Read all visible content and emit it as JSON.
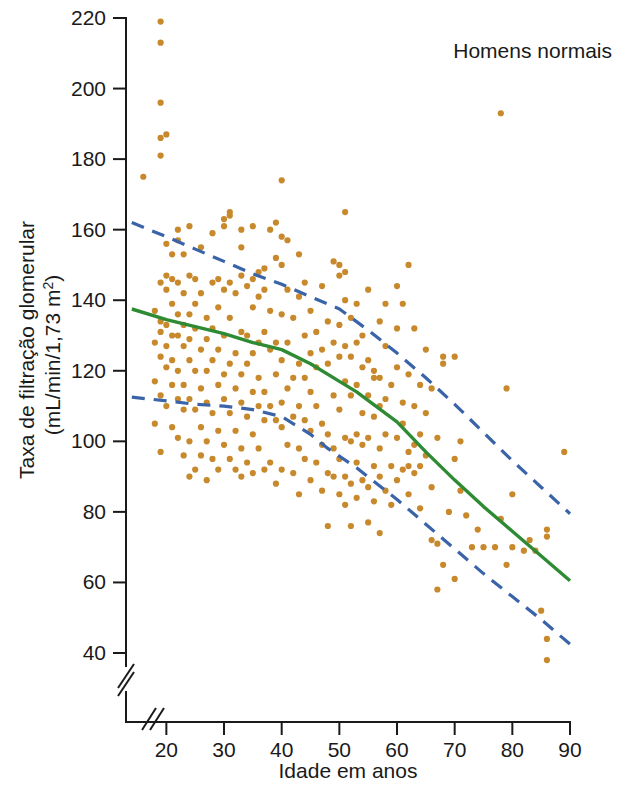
{
  "chart_data": {
    "type": "scatter",
    "title": "Homens normais",
    "xlabel": "Idade em anos",
    "ylabel_line1": "Taxa de filtração glomerular",
    "ylabel_line2": "(mL/min/1,73 m",
    "ylabel_line2_sup": "2",
    "ylabel_line2_end": ")",
    "xlim": [
      13,
      90
    ],
    "ylim": [
      33,
      222
    ],
    "xticks": [
      20,
      30,
      40,
      50,
      60,
      70,
      80,
      90
    ],
    "yticks": [
      40,
      60,
      80,
      100,
      120,
      140,
      160,
      180,
      200,
      220
    ],
    "grid": false,
    "legend": "none",
    "axis_break_x": true,
    "axis_break_y": true,
    "colors": {
      "points": "#c8892c",
      "mean_line": "#2e8b33",
      "bound_line": "#3a63a8",
      "axis": "#1a1a1a",
      "background": "#ffffff"
    },
    "series": [
      {
        "name": "Média (regressão)",
        "type": "line",
        "style": "solid",
        "color": "#2e8b33",
        "points": [
          [
            14,
            137.5
          ],
          [
            20,
            134.5
          ],
          [
            25,
            132.5
          ],
          [
            30,
            130.5
          ],
          [
            35,
            128.0
          ],
          [
            40,
            126.0
          ],
          [
            45,
            122.0
          ],
          [
            50,
            117.0
          ],
          [
            53,
            114.0
          ],
          [
            60,
            105.5
          ],
          [
            65,
            97.0
          ],
          [
            70,
            89.0
          ],
          [
            75,
            81.5
          ],
          [
            80,
            74.5
          ],
          [
            85,
            67.5
          ],
          [
            90,
            60.5
          ]
        ]
      },
      {
        "name": "Limite superior",
        "type": "line",
        "style": "dashed",
        "color": "#3a63a8",
        "points": [
          [
            14,
            162.0
          ],
          [
            20,
            158.0
          ],
          [
            25,
            154.5
          ],
          [
            30,
            151.0
          ],
          [
            35,
            147.5
          ],
          [
            40,
            144.5
          ],
          [
            45,
            141.0
          ],
          [
            50,
            137.5
          ],
          [
            55,
            131.5
          ],
          [
            60,
            125.0
          ],
          [
            65,
            118.0
          ],
          [
            70,
            110.5
          ],
          [
            75,
            102.5
          ],
          [
            80,
            94.5
          ],
          [
            85,
            87.0
          ],
          [
            90,
            79.5
          ]
        ]
      },
      {
        "name": "Limite inferior",
        "type": "line",
        "style": "dashed",
        "color": "#3a63a8",
        "points": [
          [
            14,
            112.5
          ],
          [
            20,
            111.5
          ],
          [
            25,
            110.5
          ],
          [
            30,
            110.0
          ],
          [
            35,
            109.0
          ],
          [
            40,
            107.0
          ],
          [
            45,
            102.0
          ],
          [
            48,
            98.0
          ],
          [
            53,
            92.5
          ],
          [
            60,
            83.5
          ],
          [
            65,
            76.5
          ],
          [
            70,
            69.5
          ],
          [
            75,
            62.5
          ],
          [
            80,
            56.0
          ],
          [
            85,
            49.5
          ],
          [
            90,
            42.5
          ]
        ]
      }
    ],
    "scatter_points": [
      [
        19,
        219
      ],
      [
        19,
        213
      ],
      [
        19,
        196
      ],
      [
        19,
        186
      ],
      [
        20,
        187
      ],
      [
        19,
        181
      ],
      [
        16,
        175
      ],
      [
        40,
        174
      ],
      [
        78,
        193
      ],
      [
        31,
        165
      ],
      [
        51,
        165
      ],
      [
        30,
        163
      ],
      [
        31,
        164
      ],
      [
        30,
        161
      ],
      [
        35,
        161
      ],
      [
        22,
        160
      ],
      [
        24,
        161
      ],
      [
        38,
        160
      ],
      [
        39,
        162
      ],
      [
        40,
        158
      ],
      [
        28,
        159
      ],
      [
        33,
        160
      ],
      [
        41,
        157
      ],
      [
        22,
        157
      ],
      [
        20,
        156
      ],
      [
        26,
        155
      ],
      [
        33,
        155
      ],
      [
        21,
        153
      ],
      [
        23,
        153
      ],
      [
        39,
        152
      ],
      [
        43,
        153
      ],
      [
        49,
        151
      ],
      [
        50,
        150
      ],
      [
        62,
        150
      ],
      [
        51,
        148
      ],
      [
        50,
        147
      ],
      [
        40,
        150
      ],
      [
        37,
        149
      ],
      [
        36,
        148
      ],
      [
        20,
        147
      ],
      [
        24,
        147
      ],
      [
        25,
        146
      ],
      [
        29,
        146
      ],
      [
        33,
        147
      ],
      [
        35,
        146
      ],
      [
        19,
        145
      ],
      [
        21,
        146
      ],
      [
        22,
        145
      ],
      [
        28,
        145
      ],
      [
        31,
        145
      ],
      [
        34,
        144
      ],
      [
        44,
        145
      ],
      [
        47,
        144
      ],
      [
        55,
        143
      ],
      [
        60,
        144
      ],
      [
        30,
        143
      ],
      [
        32,
        142
      ],
      [
        37,
        143
      ],
      [
        41,
        143
      ],
      [
        20,
        143
      ],
      [
        23,
        142
      ],
      [
        26,
        142
      ],
      [
        36,
        141
      ],
      [
        43,
        141
      ],
      [
        51,
        140
      ],
      [
        53,
        139
      ],
      [
        61,
        139
      ],
      [
        21,
        139
      ],
      [
        25,
        139
      ],
      [
        29,
        138
      ],
      [
        35,
        138
      ],
      [
        38,
        137
      ],
      [
        45,
        137
      ],
      [
        18,
        137
      ],
      [
        22,
        136
      ],
      [
        24,
        136
      ],
      [
        27,
        135
      ],
      [
        31,
        135
      ],
      [
        40,
        136
      ],
      [
        42,
        135
      ],
      [
        48,
        134
      ],
      [
        50,
        133
      ],
      [
        52,
        135
      ],
      [
        57,
        134
      ],
      [
        63,
        132
      ],
      [
        19,
        134
      ],
      [
        20,
        133
      ],
      [
        23,
        133
      ],
      [
        25,
        132
      ],
      [
        28,
        132
      ],
      [
        33,
        131
      ],
      [
        34,
        130
      ],
      [
        37,
        131
      ],
      [
        44,
        130
      ],
      [
        46,
        131
      ],
      [
        54,
        130
      ],
      [
        19,
        131
      ],
      [
        21,
        130
      ],
      [
        22,
        130
      ],
      [
        24,
        129
      ],
      [
        27,
        129
      ],
      [
        30,
        130
      ],
      [
        36,
        128
      ],
      [
        39,
        128
      ],
      [
        41,
        128
      ],
      [
        49,
        128
      ],
      [
        51,
        127
      ],
      [
        53,
        128
      ],
      [
        58,
        127
      ],
      [
        18,
        128
      ],
      [
        20,
        127
      ],
      [
        23,
        127
      ],
      [
        26,
        126
      ],
      [
        29,
        126
      ],
      [
        32,
        125
      ],
      [
        35,
        125
      ],
      [
        38,
        126
      ],
      [
        45,
        125
      ],
      [
        47,
        126
      ],
      [
        50,
        124
      ],
      [
        52,
        124
      ],
      [
        55,
        123
      ],
      [
        68,
        124
      ],
      [
        70,
        124
      ],
      [
        68,
        122
      ],
      [
        19,
        124
      ],
      [
        21,
        123
      ],
      [
        24,
        123
      ],
      [
        28,
        123
      ],
      [
        31,
        122
      ],
      [
        34,
        122
      ],
      [
        40,
        123
      ],
      [
        43,
        122
      ],
      [
        46,
        121
      ],
      [
        48,
        122
      ],
      [
        54,
        121
      ],
      [
        56,
        120
      ],
      [
        60,
        121
      ],
      [
        62,
        119
      ],
      [
        20,
        121
      ],
      [
        22,
        120
      ],
      [
        25,
        120
      ],
      [
        27,
        120
      ],
      [
        30,
        119
      ],
      [
        33,
        119
      ],
      [
        36,
        118
      ],
      [
        39,
        119
      ],
      [
        42,
        118
      ],
      [
        44,
        118
      ],
      [
        51,
        117
      ],
      [
        53,
        116
      ],
      [
        57,
        118
      ],
      [
        59,
        116
      ],
      [
        64,
        116
      ],
      [
        79,
        115
      ],
      [
        18,
        117
      ],
      [
        21,
        116
      ],
      [
        23,
        116
      ],
      [
        26,
        115
      ],
      [
        29,
        116
      ],
      [
        32,
        115
      ],
      [
        35,
        114
      ],
      [
        37,
        114
      ],
      [
        41,
        115
      ],
      [
        45,
        114
      ],
      [
        49,
        113
      ],
      [
        52,
        113
      ],
      [
        55,
        113
      ],
      [
        58,
        112
      ],
      [
        61,
        111
      ],
      [
        63,
        110
      ],
      [
        19,
        113
      ],
      [
        22,
        112
      ],
      [
        24,
        112
      ],
      [
        27,
        111
      ],
      [
        30,
        112
      ],
      [
        33,
        111
      ],
      [
        36,
        110
      ],
      [
        38,
        110
      ],
      [
        40,
        111
      ],
      [
        43,
        110
      ],
      [
        46,
        110
      ],
      [
        50,
        109
      ],
      [
        54,
        108
      ],
      [
        56,
        107
      ],
      [
        65,
        108
      ],
      [
        20,
        110
      ],
      [
        23,
        109
      ],
      [
        25,
        109
      ],
      [
        28,
        108
      ],
      [
        31,
        108
      ],
      [
        34,
        107
      ],
      [
        37,
        106
      ],
      [
        39,
        106
      ],
      [
        42,
        107
      ],
      [
        44,
        106
      ],
      [
        47,
        105
      ],
      [
        18,
        105
      ],
      [
        21,
        104
      ],
      [
        26,
        104
      ],
      [
        29,
        103
      ],
      [
        32,
        103
      ],
      [
        35,
        102
      ],
      [
        40,
        104
      ],
      [
        45,
        103
      ],
      [
        48,
        102
      ],
      [
        51,
        101
      ],
      [
        53,
        102
      ],
      [
        55,
        101
      ],
      [
        58,
        102
      ],
      [
        60,
        101
      ],
      [
        67,
        101
      ],
      [
        71,
        100
      ],
      [
        22,
        101
      ],
      [
        24,
        100
      ],
      [
        27,
        100
      ],
      [
        30,
        99
      ],
      [
        33,
        98
      ],
      [
        36,
        98
      ],
      [
        41,
        99
      ],
      [
        43,
        98
      ],
      [
        47,
        99
      ],
      [
        49,
        98
      ],
      [
        52,
        100
      ],
      [
        54,
        99
      ],
      [
        57,
        98
      ],
      [
        62,
        97
      ],
      [
        65,
        96
      ],
      [
        89,
        97
      ],
      [
        19,
        97
      ],
      [
        23,
        96
      ],
      [
        26,
        96
      ],
      [
        28,
        95
      ],
      [
        31,
        95
      ],
      [
        34,
        94
      ],
      [
        38,
        94
      ],
      [
        44,
        95
      ],
      [
        46,
        94
      ],
      [
        50,
        95
      ],
      [
        53,
        94
      ],
      [
        56,
        93
      ],
      [
        59,
        93
      ],
      [
        61,
        92
      ],
      [
        70,
        95
      ],
      [
        25,
        92
      ],
      [
        29,
        92
      ],
      [
        32,
        92
      ],
      [
        35,
        91
      ],
      [
        37,
        92
      ],
      [
        40,
        92
      ],
      [
        42,
        91
      ],
      [
        48,
        91
      ],
      [
        51,
        90
      ],
      [
        54,
        89
      ],
      [
        57,
        90
      ],
      [
        60,
        89
      ],
      [
        63,
        91
      ],
      [
        24,
        90
      ],
      [
        27,
        89
      ],
      [
        33,
        90
      ],
      [
        39,
        88
      ],
      [
        45,
        89
      ],
      [
        49,
        90
      ],
      [
        52,
        88
      ],
      [
        55,
        87
      ],
      [
        58,
        86
      ],
      [
        62,
        85
      ],
      [
        66,
        87
      ],
      [
        71,
        86
      ],
      [
        72,
        79
      ],
      [
        43,
        85
      ],
      [
        47,
        86
      ],
      [
        50,
        85
      ],
      [
        53,
        84
      ],
      [
        56,
        83
      ],
      [
        59,
        82
      ],
      [
        64,
        81
      ],
      [
        69,
        80
      ],
      [
        51,
        82
      ],
      [
        55,
        77
      ],
      [
        48,
        76
      ],
      [
        52,
        76
      ],
      [
        57,
        74
      ],
      [
        66,
        72
      ],
      [
        67,
        71
      ],
      [
        73,
        70
      ],
      [
        75,
        70
      ],
      [
        77,
        70
      ],
      [
        80,
        70
      ],
      [
        82,
        69
      ],
      [
        84,
        69
      ],
      [
        83,
        72
      ],
      [
        86,
        73
      ],
      [
        86,
        75
      ],
      [
        80,
        85
      ],
      [
        78,
        78
      ],
      [
        74,
        75
      ],
      [
        68,
        65
      ],
      [
        79,
        65
      ],
      [
        67,
        58
      ],
      [
        70,
        61
      ],
      [
        85,
        52
      ],
      [
        86,
        44
      ],
      [
        86,
        38
      ],
      [
        62,
        93
      ],
      [
        64,
        93
      ],
      [
        63,
        99
      ],
      [
        60,
        132
      ],
      [
        58,
        139
      ],
      [
        65,
        126
      ],
      [
        66,
        115
      ],
      [
        61,
        105
      ],
      [
        64,
        102
      ],
      [
        57,
        110
      ],
      [
        56,
        118
      ]
    ]
  }
}
